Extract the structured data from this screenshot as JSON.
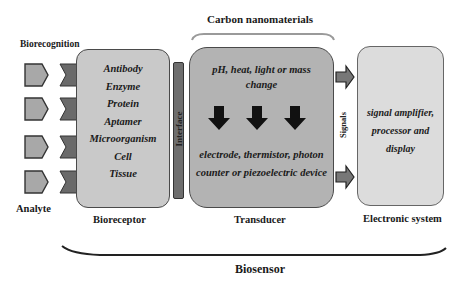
{
  "title": "Biosensor",
  "top_label": "Carbon nanomaterials",
  "left_labels": {
    "biorecognition": "Biorecognition",
    "analyte": "Analyte"
  },
  "bioreceptor": {
    "label": "Bioreceptor",
    "items": [
      "Antibody",
      "Enzyme",
      "Protein",
      "Aptamer",
      "Microorganism",
      "Cell",
      "Tissue"
    ]
  },
  "interface": {
    "label": "Interface"
  },
  "transducer": {
    "label": "Transducer",
    "top_text": "pH, heat, light or mass change",
    "bottom_text": "electrode, thermistor, photon counter or piezoelectric device",
    "arrows": 3
  },
  "signals": {
    "label": "Signals"
  },
  "electronic": {
    "label": "Electronic system",
    "text": "signal amplifier, processor and display"
  },
  "colors": {
    "bioreceptor_fill": "#c9c9c9",
    "transducer_fill": "#b3b3b3",
    "electronic_fill": "#dcdcdc",
    "interface_fill": "#6e6e6e",
    "analyte_fill": "#a8a8a8",
    "receptor_notch_fill": "#6a6a6a",
    "arrow_fill": "#111111"
  }
}
